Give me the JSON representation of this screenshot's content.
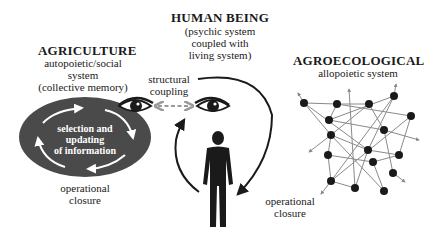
{
  "agriculture": {
    "title": "AGRICULTURE",
    "lines": [
      "autopoietic/social",
      "system",
      "(collective memory)"
    ],
    "loop_text": [
      "selection and",
      "updating",
      "of information"
    ],
    "closure_label": [
      "operational",
      "closure"
    ]
  },
  "human": {
    "title": "HUMAN BEING",
    "lines": [
      "(psychic system",
      "coupled with",
      "living system)"
    ],
    "closure_label": [
      "operational",
      "closure"
    ]
  },
  "coupling": {
    "label": [
      "structural",
      "coupling"
    ]
  },
  "agroecological": {
    "title": "AGROECOLOGICAL",
    "subtitle": "allopoietic system"
  },
  "colors": {
    "ellipse_fill": "#4a4a4a",
    "ink": "#1a1a1a",
    "network_line": "#8a8a8a",
    "coupling_arrow": "#9a9a9a"
  },
  "icons": [
    "eye-icon",
    "eye-icon",
    "person-icon",
    "network-graph",
    "double-arrow-icon"
  ]
}
